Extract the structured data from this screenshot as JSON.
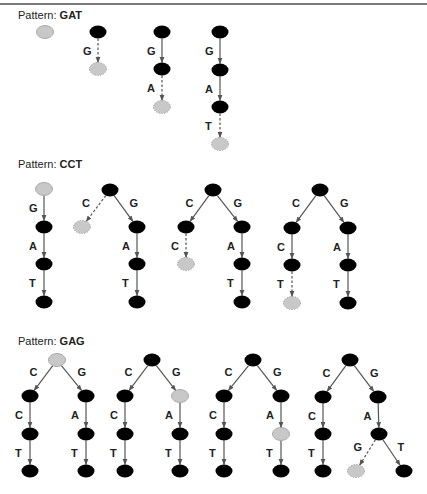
{
  "colors": {
    "solid_node": "#000000",
    "candidate_node": "#c8c8c8",
    "edge": "#555555"
  },
  "sections": [
    {
      "label_prefix": "Pattern:",
      "pattern": "GAT",
      "label_y": 9,
      "trees": [
        {
          "nodes": [
            {
              "id": "n0",
              "x": 45,
              "y": 32,
              "type": "candidate"
            }
          ],
          "edges": []
        },
        {
          "nodes": [
            {
              "id": "n0",
              "x": 98,
              "y": 32,
              "type": "solid"
            },
            {
              "id": "n1",
              "x": 98,
              "y": 69,
              "type": "candidate"
            }
          ],
          "edges": [
            {
              "from": "n0",
              "to": "n1",
              "label": "G",
              "dashed": true
            }
          ]
        },
        {
          "nodes": [
            {
              "id": "n0",
              "x": 162,
              "y": 32,
              "type": "solid"
            },
            {
              "id": "n1",
              "x": 162,
              "y": 69,
              "type": "solid"
            },
            {
              "id": "n2",
              "x": 162,
              "y": 107,
              "type": "candidate"
            }
          ],
          "edges": [
            {
              "from": "n0",
              "to": "n1",
              "label": "G",
              "dashed": false
            },
            {
              "from": "n1",
              "to": "n2",
              "label": "A",
              "dashed": true
            }
          ]
        },
        {
          "nodes": [
            {
              "id": "n0",
              "x": 220,
              "y": 32,
              "type": "solid"
            },
            {
              "id": "n1",
              "x": 220,
              "y": 70,
              "type": "solid"
            },
            {
              "id": "n2",
              "x": 220,
              "y": 107,
              "type": "solid"
            },
            {
              "id": "n3",
              "x": 220,
              "y": 144,
              "type": "candidate"
            }
          ],
          "edges": [
            {
              "from": "n0",
              "to": "n1",
              "label": "G",
              "dashed": false
            },
            {
              "from": "n1",
              "to": "n2",
              "label": "A",
              "dashed": false
            },
            {
              "from": "n2",
              "to": "n3",
              "label": "T",
              "dashed": true
            }
          ]
        }
      ]
    },
    {
      "label_prefix": "Pattern:",
      "pattern": "CCT",
      "label_y": 158,
      "trees": [
        {
          "nodes": [
            {
              "id": "n0",
              "x": 44,
              "y": 189,
              "type": "candidate"
            },
            {
              "id": "n1",
              "x": 44,
              "y": 227,
              "type": "solid"
            },
            {
              "id": "n2",
              "x": 44,
              "y": 264,
              "type": "solid"
            },
            {
              "id": "n3",
              "x": 44,
              "y": 302,
              "type": "solid"
            }
          ],
          "edges": [
            {
              "from": "n0",
              "to": "n1",
              "label": "G",
              "dashed": false
            },
            {
              "from": "n1",
              "to": "n2",
              "label": "A",
              "dashed": false
            },
            {
              "from": "n2",
              "to": "n3",
              "label": "T",
              "dashed": false
            }
          ]
        },
        {
          "nodes": [
            {
              "id": "r",
              "x": 110,
              "y": 190,
              "type": "solid"
            },
            {
              "id": "l",
              "x": 82,
              "y": 227,
              "type": "candidate"
            },
            {
              "id": "g",
              "x": 137,
              "y": 227,
              "type": "solid"
            },
            {
              "id": "a",
              "x": 137,
              "y": 264,
              "type": "solid"
            },
            {
              "id": "t",
              "x": 137,
              "y": 302,
              "type": "solid"
            }
          ],
          "edges": [
            {
              "from": "r",
              "to": "l",
              "label": "C",
              "dashed": true
            },
            {
              "from": "r",
              "to": "g",
              "label": "G",
              "dashed": false
            },
            {
              "from": "g",
              "to": "a",
              "label": "A",
              "dashed": false
            },
            {
              "from": "a",
              "to": "t",
              "label": "T",
              "dashed": false
            }
          ]
        },
        {
          "nodes": [
            {
              "id": "r",
              "x": 213,
              "y": 190,
              "type": "solid"
            },
            {
              "id": "c1",
              "x": 186,
              "y": 227,
              "type": "solid"
            },
            {
              "id": "c2",
              "x": 186,
              "y": 264,
              "type": "candidate"
            },
            {
              "id": "g",
              "x": 242,
              "y": 227,
              "type": "solid"
            },
            {
              "id": "a",
              "x": 242,
              "y": 264,
              "type": "solid"
            },
            {
              "id": "t",
              "x": 242,
              "y": 302,
              "type": "solid"
            }
          ],
          "edges": [
            {
              "from": "r",
              "to": "c1",
              "label": "C",
              "dashed": false
            },
            {
              "from": "c1",
              "to": "c2",
              "label": "C",
              "dashed": true
            },
            {
              "from": "r",
              "to": "g",
              "label": "G",
              "dashed": false
            },
            {
              "from": "g",
              "to": "a",
              "label": "A",
              "dashed": false
            },
            {
              "from": "a",
              "to": "t",
              "label": "T",
              "dashed": false
            }
          ]
        },
        {
          "nodes": [
            {
              "id": "r",
              "x": 320,
              "y": 190,
              "type": "solid"
            },
            {
              "id": "c1",
              "x": 292,
              "y": 228,
              "type": "solid"
            },
            {
              "id": "c2",
              "x": 292,
              "y": 265,
              "type": "solid"
            },
            {
              "id": "c3",
              "x": 292,
              "y": 303,
              "type": "candidate"
            },
            {
              "id": "g",
              "x": 348,
              "y": 228,
              "type": "solid"
            },
            {
              "id": "a",
              "x": 348,
              "y": 265,
              "type": "solid"
            },
            {
              "id": "t",
              "x": 348,
              "y": 303,
              "type": "solid"
            }
          ],
          "edges": [
            {
              "from": "r",
              "to": "c1",
              "label": "C",
              "dashed": false
            },
            {
              "from": "c1",
              "to": "c2",
              "label": "C",
              "dashed": false
            },
            {
              "from": "c2",
              "to": "c3",
              "label": "T",
              "dashed": true
            },
            {
              "from": "r",
              "to": "g",
              "label": "G",
              "dashed": false
            },
            {
              "from": "g",
              "to": "a",
              "label": "A",
              "dashed": false
            },
            {
              "from": "a",
              "to": "t",
              "label": "T",
              "dashed": false
            }
          ]
        }
      ]
    },
    {
      "label_prefix": "Pattern:",
      "pattern": "GAG",
      "label_y": 335,
      "trees": [
        {
          "nodes": [
            {
              "id": "r",
              "x": 57,
              "y": 360,
              "type": "candidate"
            },
            {
              "id": "c1",
              "x": 30,
              "y": 396,
              "type": "solid"
            },
            {
              "id": "c2",
              "x": 30,
              "y": 434,
              "type": "solid"
            },
            {
              "id": "c3",
              "x": 30,
              "y": 471,
              "type": "solid"
            },
            {
              "id": "g",
              "x": 86,
              "y": 396,
              "type": "solid"
            },
            {
              "id": "a",
              "x": 86,
              "y": 434,
              "type": "solid"
            },
            {
              "id": "t",
              "x": 86,
              "y": 471,
              "type": "solid"
            }
          ],
          "edges": [
            {
              "from": "r",
              "to": "c1",
              "label": "C",
              "dashed": false
            },
            {
              "from": "c1",
              "to": "c2",
              "label": "C",
              "dashed": false
            },
            {
              "from": "c2",
              "to": "c3",
              "label": "T",
              "dashed": false
            },
            {
              "from": "r",
              "to": "g",
              "label": "G",
              "dashed": false
            },
            {
              "from": "g",
              "to": "a",
              "label": "A",
              "dashed": false
            },
            {
              "from": "a",
              "to": "t",
              "label": "T",
              "dashed": false
            }
          ]
        },
        {
          "nodes": [
            {
              "id": "r",
              "x": 152,
              "y": 360,
              "type": "solid"
            },
            {
              "id": "c1",
              "x": 125,
              "y": 396,
              "type": "solid"
            },
            {
              "id": "c2",
              "x": 125,
              "y": 434,
              "type": "solid"
            },
            {
              "id": "c3",
              "x": 125,
              "y": 471,
              "type": "solid"
            },
            {
              "id": "g",
              "x": 180,
              "y": 396,
              "type": "candidate"
            },
            {
              "id": "a",
              "x": 180,
              "y": 434,
              "type": "solid"
            },
            {
              "id": "t",
              "x": 180,
              "y": 471,
              "type": "solid"
            }
          ],
          "edges": [
            {
              "from": "r",
              "to": "c1",
              "label": "C",
              "dashed": false
            },
            {
              "from": "c1",
              "to": "c2",
              "label": "C",
              "dashed": false
            },
            {
              "from": "c2",
              "to": "c3",
              "label": "T",
              "dashed": false
            },
            {
              "from": "r",
              "to": "g",
              "label": "G",
              "dashed": false
            },
            {
              "from": "g",
              "to": "a",
              "label": "A",
              "dashed": false
            },
            {
              "from": "a",
              "to": "t",
              "label": "T",
              "dashed": false
            }
          ]
        },
        {
          "nodes": [
            {
              "id": "r",
              "x": 253,
              "y": 360,
              "type": "solid"
            },
            {
              "id": "c1",
              "x": 224,
              "y": 396,
              "type": "solid"
            },
            {
              "id": "c2",
              "x": 224,
              "y": 434,
              "type": "solid"
            },
            {
              "id": "c3",
              "x": 224,
              "y": 471,
              "type": "solid"
            },
            {
              "id": "g",
              "x": 281,
              "y": 396,
              "type": "solid"
            },
            {
              "id": "a",
              "x": 281,
              "y": 434,
              "type": "candidate"
            },
            {
              "id": "t",
              "x": 281,
              "y": 471,
              "type": "solid"
            }
          ],
          "edges": [
            {
              "from": "r",
              "to": "c1",
              "label": "C",
              "dashed": false
            },
            {
              "from": "c1",
              "to": "c2",
              "label": "C",
              "dashed": false
            },
            {
              "from": "c2",
              "to": "c3",
              "label": "T",
              "dashed": false
            },
            {
              "from": "r",
              "to": "g",
              "label": "G",
              "dashed": false
            },
            {
              "from": "g",
              "to": "a",
              "label": "A",
              "dashed": false
            },
            {
              "from": "a",
              "to": "t",
              "label": "T",
              "dashed": false
            }
          ]
        },
        {
          "nodes": [
            {
              "id": "r",
              "x": 350,
              "y": 360,
              "type": "solid"
            },
            {
              "id": "c1",
              "x": 323,
              "y": 397,
              "type": "solid"
            },
            {
              "id": "c2",
              "x": 323,
              "y": 434,
              "type": "solid"
            },
            {
              "id": "c3",
              "x": 323,
              "y": 471,
              "type": "solid"
            },
            {
              "id": "g",
              "x": 378,
              "y": 397,
              "type": "solid"
            },
            {
              "id": "a",
              "x": 379,
              "y": 434,
              "type": "solid"
            },
            {
              "id": "gg",
              "x": 356,
              "y": 471,
              "type": "candidate"
            },
            {
              "id": "t",
              "x": 404,
              "y": 471,
              "type": "solid"
            }
          ],
          "edges": [
            {
              "from": "r",
              "to": "c1",
              "label": "C",
              "dashed": false
            },
            {
              "from": "c1",
              "to": "c2",
              "label": "C",
              "dashed": false
            },
            {
              "from": "c2",
              "to": "c3",
              "label": "T",
              "dashed": false
            },
            {
              "from": "r",
              "to": "g",
              "label": "G",
              "dashed": false
            },
            {
              "from": "g",
              "to": "a",
              "label": "A",
              "dashed": false
            },
            {
              "from": "a",
              "to": "gg",
              "label": "G",
              "dashed": true
            },
            {
              "from": "a",
              "to": "t",
              "label": "T",
              "dashed": false
            }
          ]
        }
      ]
    }
  ]
}
